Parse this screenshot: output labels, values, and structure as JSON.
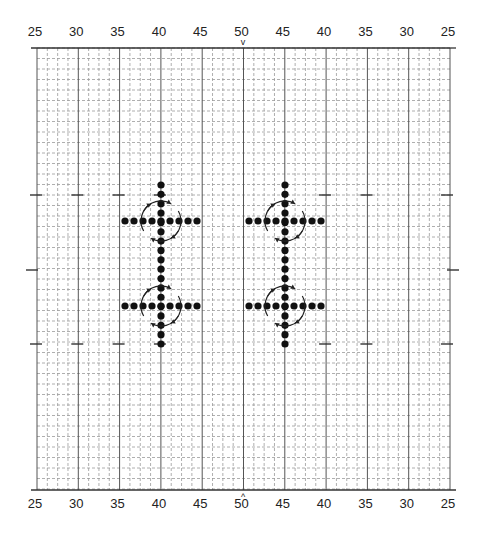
{
  "figure": {
    "type": "dance-formation-chart",
    "top_axis_labels": [
      "25",
      "30",
      "35",
      "40",
      "45",
      "50",
      "45",
      "40",
      "35",
      "30",
      "25"
    ],
    "bottom_axis_labels": [
      "25",
      "30",
      "35",
      "40",
      "45",
      "50",
      "45",
      "40",
      "35",
      "30",
      "25"
    ],
    "center_marker_top": "v",
    "center_marker_bottom": "^",
    "grid": {
      "left": 37,
      "right": 450,
      "top": 48,
      "bottom": 490,
      "major_columns": 10,
      "minor_per_major": 4,
      "row_spacing": 10.5
    },
    "side_dash_rows_y": [
      195,
      270,
      344
    ],
    "formations": [
      {
        "id": "left-top",
        "cx": 161,
        "cy": 221,
        "radius": 20
      },
      {
        "id": "left-bottom",
        "cx": 161,
        "cy": 306,
        "radius": 20
      },
      {
        "id": "right-top",
        "cx": 285,
        "cy": 221,
        "radius": 20
      },
      {
        "id": "right-bottom",
        "cx": 285,
        "cy": 306,
        "radius": 20
      }
    ],
    "vertical_columns": [
      {
        "x": 161,
        "y_start": 185,
        "y_end": 344
      },
      {
        "x": 285,
        "y_start": 185,
        "y_end": 344
      }
    ],
    "dot_spacing": 9,
    "dots_per_row": 9,
    "colors": {
      "dot": "#111111",
      "major_line": "#555555",
      "minor_line": "#9a9a9a",
      "text": "#222222"
    }
  }
}
